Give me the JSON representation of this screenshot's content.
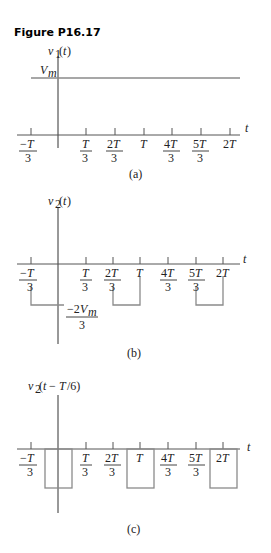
{
  "figure_title": "Figure P16.17",
  "panels": [
    {
      "id": "a",
      "caption": "(a)",
      "ylabel": "v₁(t)",
      "level_label": "Vₘ",
      "type": "constant"
    },
    {
      "id": "b",
      "caption": "(b)",
      "ylabel": "v₂(t)",
      "level_label": "−2Vₘ/3",
      "type": "pulse-train"
    },
    {
      "id": "c",
      "caption": "(c)",
      "ylabel": "v₂(t − T/6)",
      "type": "shifted-pulse-train"
    }
  ],
  "tick_labels": [
    "−T/3",
    "T/3",
    "2T/3",
    "T",
    "4T/3",
    "5T/3",
    "2T"
  ],
  "axis_label": "t",
  "colors": {
    "signal": "#8a8a8a",
    "axis": "#333333"
  }
}
